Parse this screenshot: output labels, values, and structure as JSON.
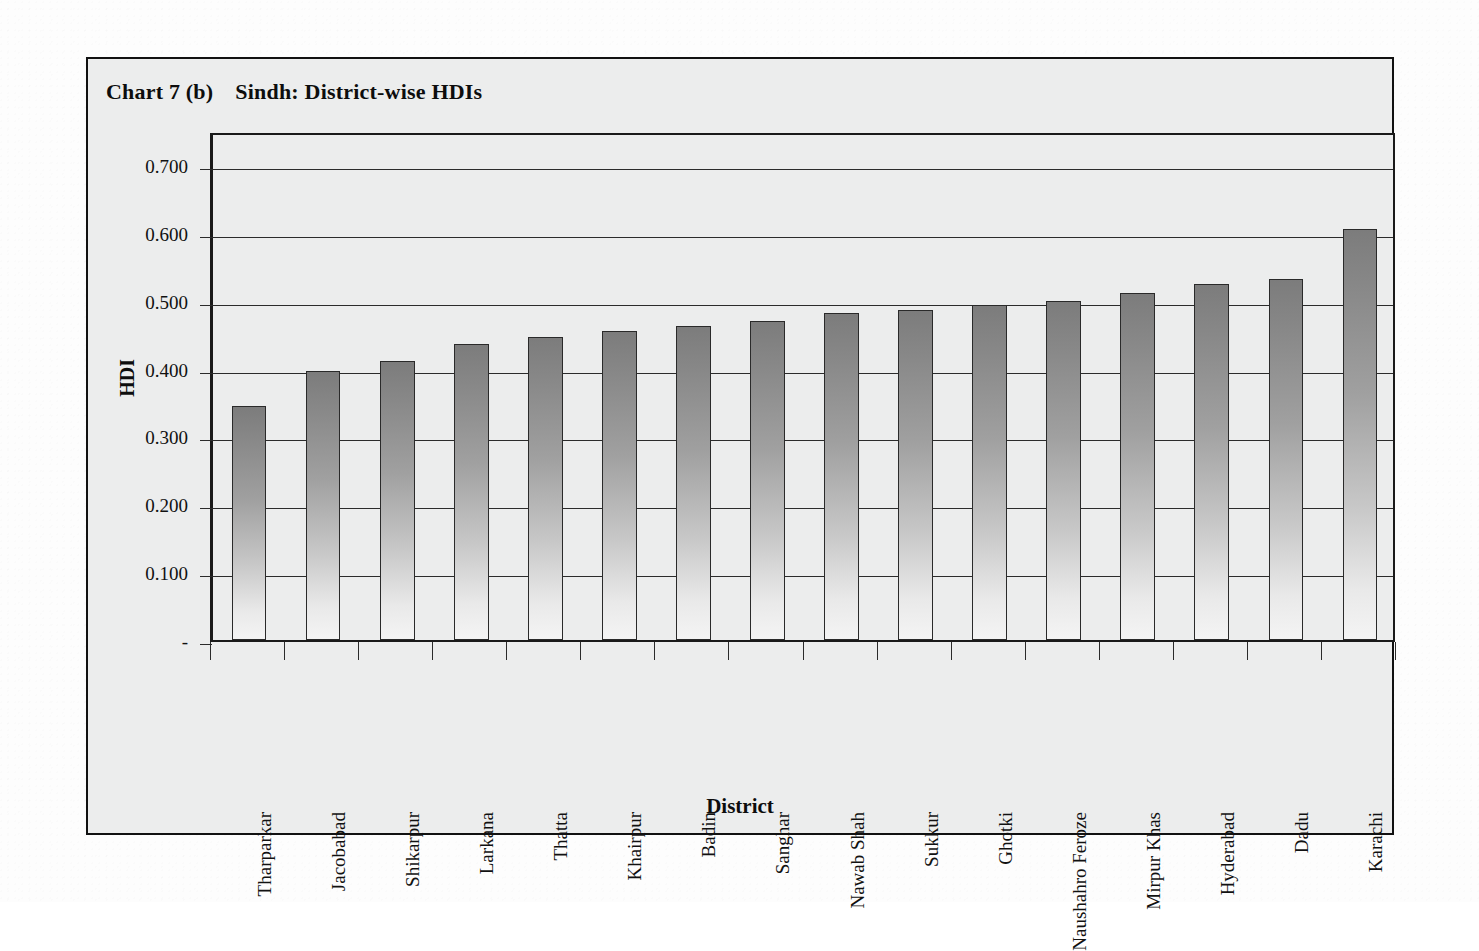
{
  "chart_data": {
    "type": "bar",
    "title": "Chart 7 (b)",
    "subtitle": "Sindh: District-wise HDIs",
    "xlabel": "District",
    "ylabel": "HDI",
    "ylim": [
      0,
      0.75
    ],
    "grid": true,
    "legend": "none",
    "ytick_labels": [
      "0.700",
      "0.600",
      "0.500",
      "0.400",
      "0.300",
      "0.200",
      "0.100",
      "-"
    ],
    "ytick_values": [
      0.7,
      0.6,
      0.5,
      0.4,
      0.3,
      0.2,
      0.1,
      0
    ],
    "categories": [
      "Tharparkar",
      "Jacobabad",
      "Shikarpur",
      "Larkana",
      "Thatta",
      "Khairpur",
      "Badin",
      "Sanghar",
      "Nawab Shah",
      "Sukkur",
      "Ghotki",
      "Naushahro Feroze",
      "Mirpur Khas",
      "Hyderabad",
      "Dadu",
      "Karachi"
    ],
    "values": [
      0.345,
      0.396,
      0.411,
      0.436,
      0.447,
      0.455,
      0.462,
      0.47,
      0.482,
      0.486,
      0.493,
      0.5,
      0.512,
      0.524,
      0.532,
      0.606
    ],
    "series_name": "HDI",
    "bar_color_top": "#7c7c7c",
    "bar_color_bottom": "#f4f4f4",
    "bar_border_color": "#2a2a2a",
    "plot_background": "#eceded",
    "axis_color": "#1a1a1a"
  },
  "frame": {
    "background": "#eceded",
    "border_color": "#111111"
  }
}
